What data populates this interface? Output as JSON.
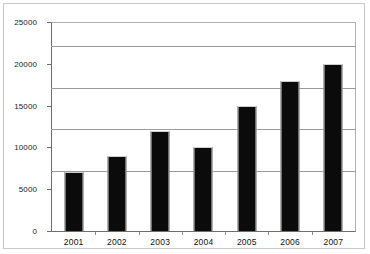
{
  "chart_data": {
    "type": "bar",
    "title": "",
    "subtitle": "",
    "xlabel": "",
    "ylabel": "",
    "categories": [
      "2001",
      "2002",
      "2003",
      "2004",
      "2005",
      "2006",
      "2007"
    ],
    "values": [
      7000,
      9000,
      12000,
      10000,
      15000,
      18000,
      20000
    ],
    "series": [
      {
        "name": "",
        "values": [
          7000,
          9000,
          12000,
          10000,
          15000,
          18000,
          20000
        ],
        "color": "#0b0b0b"
      }
    ],
    "ylim": [
      0,
      25000
    ],
    "y_ticks": [
      0,
      5000,
      10000,
      15000,
      20000,
      25000
    ],
    "y_tick_labels": [
      "0",
      "5000",
      "10000",
      "15000",
      "20000",
      "25000"
    ],
    "grid": "horizontal",
    "legend": "none",
    "bar_color": "#0b0b0b",
    "gridline_color": "#9a9a9a",
    "axis_color": "#6e6e6e",
    "frame_color": "#c9c9c9",
    "background": "#ffffff"
  }
}
